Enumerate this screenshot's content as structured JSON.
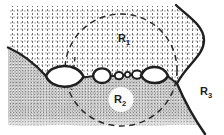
{
  "figure": {
    "kind": "grain-boundary-cavitation-diagram",
    "background_color": "#ffffff",
    "ink_color": "#1f1f1f"
  },
  "labels": {
    "r1": {
      "base": "R",
      "sub": "1"
    },
    "r2": {
      "base": "R",
      "sub": "2"
    },
    "r3": {
      "base": "R",
      "sub": "3"
    }
  },
  "regions": {
    "r1": {
      "name": "upper grain",
      "texture": "sparse-stipple",
      "fill": "#ffffff",
      "dot_color": "#6e6e6e"
    },
    "r2": {
      "name": "lower grain",
      "texture": "dense-stipple",
      "fill": "#c9c9c9",
      "dot_color": "#858585"
    },
    "r3": {
      "name": "right grain",
      "texture": "plain",
      "fill": "#ffffff"
    }
  },
  "elements": {
    "cavity_count": 6,
    "dashed_circle": {
      "cx": 121,
      "cy": 70,
      "r": 56
    },
    "dashed_line_through_left_cavity": true
  }
}
